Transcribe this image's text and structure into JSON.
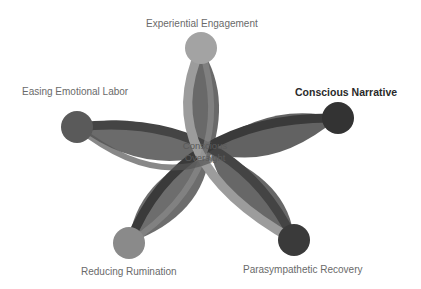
{
  "diagram": {
    "center_label_line1": "Conscious",
    "center_label_line2": "Oversight",
    "nodes": [
      {
        "label": "Experiential Engagement",
        "color": "#a3a3a3"
      },
      {
        "label": "Conscious Narrative",
        "color": "#333333",
        "emphasized": true
      },
      {
        "label": "Parasympathetic Recovery",
        "color": "#3a3a3a"
      },
      {
        "label": "Reducing Rumination",
        "color": "#8a8a8a"
      },
      {
        "label": "Easing Emotional Labor",
        "color": "#5a5a5a"
      }
    ],
    "colors": {
      "petal": "#5e5e5e",
      "petal_light": "#6e6e6e",
      "arc_light": "#9a9a9a",
      "arc_dark": "#3c3c3c"
    }
  }
}
